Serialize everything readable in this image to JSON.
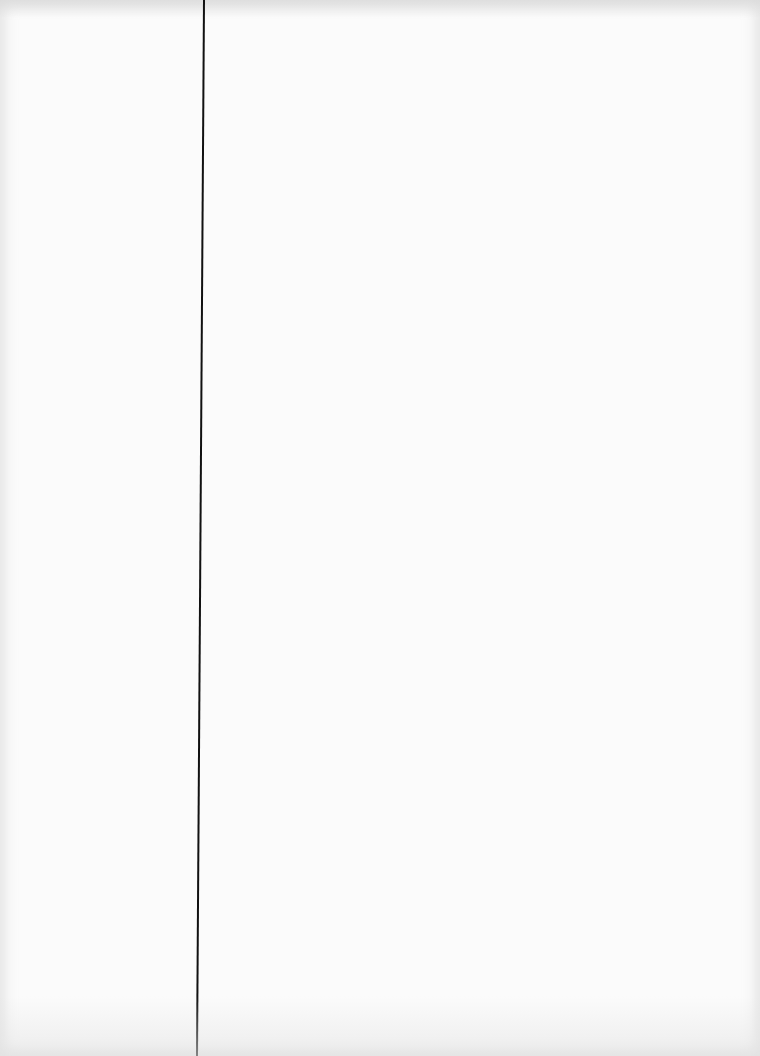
{
  "document": {
    "type": "scanned blank page",
    "text": "",
    "margin_line": {
      "orientation": "vertical",
      "x_top": 203,
      "x_bottom": 210,
      "width_px": 2,
      "color": "#111111"
    },
    "background_color": "#fbfbfb"
  }
}
